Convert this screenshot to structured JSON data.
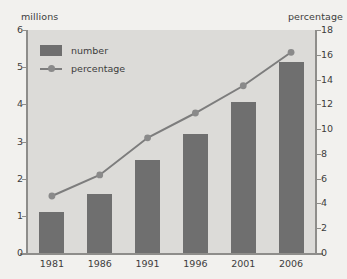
{
  "chart_data": {
    "type": "bar",
    "title": "",
    "subtitle": "",
    "categories": [
      "1981",
      "1986",
      "1991",
      "1996",
      "2001",
      "2006"
    ],
    "xlabel": "",
    "grid": false,
    "legend_position": "top-left",
    "series": [
      {
        "name": "number",
        "type": "bar",
        "axis": "left",
        "unit": "millions",
        "values": [
          1.1,
          1.6,
          2.5,
          3.2,
          4.05,
          5.15
        ],
        "color": "#6f6f6f"
      },
      {
        "name": "percentage",
        "type": "line",
        "axis": "right",
        "unit": "percentage",
        "values": [
          4.6,
          6.3,
          9.3,
          11.3,
          13.5,
          16.2
        ],
        "color": "#7d7d7d"
      }
    ],
    "axes": {
      "left": {
        "label": "millions",
        "ylim": [
          0,
          6
        ],
        "ticks": [
          "0",
          "1",
          "2",
          "3",
          "4",
          "5",
          "6"
        ],
        "tick_values": [
          0,
          1,
          2,
          3,
          4,
          5,
          6
        ]
      },
      "right": {
        "label": "percentage",
        "ylim": [
          0,
          18
        ],
        "ticks": [
          "0",
          "2",
          "4",
          "6",
          "8",
          "10",
          "12",
          "14",
          "16",
          "18"
        ],
        "tick_values": [
          0,
          2,
          4,
          6,
          8,
          10,
          12,
          14,
          16,
          18
        ]
      }
    },
    "colors": {
      "bar": "#6f6f6f",
      "line": "#7d7d7d",
      "marker": "#8a8a8a",
      "plot_background": "#dcdbd8",
      "page_background": "#f2f1ee",
      "axis": "#8e8d8a",
      "text": "#3d3d3d"
    }
  },
  "legend": {
    "items": [
      {
        "label": "number"
      },
      {
        "label": "percentage"
      }
    ]
  }
}
